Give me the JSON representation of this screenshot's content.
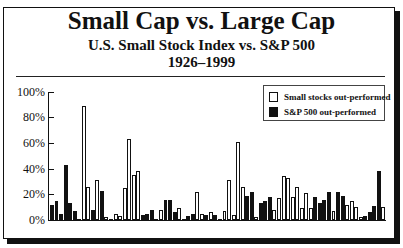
{
  "chart_data": {
    "type": "bar",
    "title": "Small Cap vs. Large Cap",
    "subtitle": "U.S. Small Stock Index vs. S&P 500",
    "period": "1926–1999",
    "xlabel": "",
    "ylabel": "",
    "ylim": [
      0,
      100
    ],
    "y_ticks": [
      "0%",
      "20%",
      "40%",
      "60%",
      "80%",
      "100%"
    ],
    "grid": false,
    "legend_position": "upper-right",
    "legend": [
      {
        "key": "W",
        "label": "Small stocks out-performed",
        "color": "#ffffff"
      },
      {
        "key": "B",
        "label": "S&P 500 out-performed",
        "color": "#111111"
      }
    ],
    "categories": [
      1926,
      1927,
      1928,
      1929,
      1930,
      1931,
      1932,
      1933,
      1934,
      1935,
      1936,
      1937,
      1938,
      1939,
      1940,
      1941,
      1942,
      1943,
      1944,
      1945,
      1946,
      1947,
      1948,
      1949,
      1950,
      1951,
      1952,
      1953,
      1954,
      1955,
      1956,
      1957,
      1958,
      1959,
      1960,
      1961,
      1962,
      1963,
      1964,
      1965,
      1966,
      1967,
      1968,
      1969,
      1970,
      1971,
      1972,
      1973,
      1974,
      1975,
      1976,
      1977,
      1978,
      1979,
      1980,
      1981,
      1982,
      1983,
      1984,
      1985,
      1986,
      1987,
      1988,
      1989,
      1990,
      1991,
      1992,
      1993,
      1994,
      1995,
      1996,
      1997,
      1998,
      1999
    ],
    "values": [
      12,
      15,
      5,
      43,
      13,
      7,
      1,
      89,
      26,
      8,
      31,
      23,
      2,
      1,
      5,
      3,
      25,
      63,
      35,
      38,
      4,
      5,
      8,
      1,
      8,
      16,
      16,
      6,
      9,
      1,
      3,
      5,
      22,
      5,
      4,
      6,
      4,
      1,
      7,
      31,
      4,
      61,
      26,
      19,
      22,
      2,
      13,
      15,
      18,
      8,
      17,
      34,
      33,
      18,
      26,
      9,
      21,
      9,
      18,
      13,
      16,
      22,
      7,
      22,
      19,
      12,
      15,
      10,
      2,
      3,
      6,
      11,
      38,
      10
    ],
    "winner": [
      "B",
      "B",
      "B",
      "B",
      "B",
      "B",
      "W",
      "W",
      "W",
      "B",
      "W",
      "B",
      "W",
      "W",
      "W",
      "W",
      "W",
      "W",
      "W",
      "W",
      "B",
      "B",
      "B",
      "W",
      "W",
      "B",
      "B",
      "B",
      "W",
      "W",
      "B",
      "B",
      "W",
      "W",
      "B",
      "W",
      "B",
      "W",
      "W",
      "W",
      "W",
      "W",
      "W",
      "B",
      "B",
      "W",
      "B",
      "B",
      "B",
      "W",
      "W",
      "W",
      "W",
      "W",
      "W",
      "W",
      "W",
      "W",
      "B",
      "B",
      "B",
      "B",
      "W",
      "B",
      "B",
      "W",
      "W",
      "W",
      "W",
      "B",
      "B",
      "B",
      "B",
      "W"
    ]
  },
  "header": {
    "title": "Small Cap vs. Large Cap",
    "subtitle": "U.S. Small Stock Index vs. S&P 500",
    "years": "1926–1999"
  },
  "legend": {
    "small": "Small stocks out-performed",
    "sp500": "S&P 500 out-performed"
  },
  "axis": {
    "y0": "0%",
    "y20": "20%",
    "y40": "40%",
    "y60": "60%",
    "y80": "80%",
    "y100": "100%"
  }
}
